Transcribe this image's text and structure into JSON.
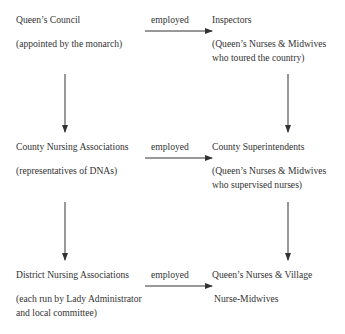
{
  "diagram": {
    "rows": [
      {
        "left": {
          "title": "Queen’s Council",
          "note_lines": [
            "(appointed by the monarch)"
          ]
        },
        "relation": "employed",
        "right": {
          "title": "Inspectors",
          "note_lines": [
            "(Queen’s Nurses & Midwives",
            "who toured the country)"
          ]
        }
      },
      {
        "left": {
          "title": "County Nursing Associations",
          "note_lines": [
            "(representatives of DNAs)"
          ]
        },
        "relation": "employed",
        "right": {
          "title": "County Superintendents",
          "note_lines": [
            "(Queen’s Nurses & Midwives",
            "who supervised nurses)"
          ]
        }
      },
      {
        "left": {
          "title": "District Nursing Associations",
          "note_lines": [
            "(each run by Lady Administrator",
            "and local committee)"
          ]
        },
        "relation": "employed",
        "right": {
          "title": "Queen’s Nurses & Village",
          "note_lines": [
            "Nurse-Midwives"
          ]
        }
      }
    ],
    "edges": [
      {
        "from": "Queen’s Council",
        "to": "Inspectors",
        "label": "employed"
      },
      {
        "from": "Queen’s Council",
        "to": "County Nursing Associations"
      },
      {
        "from": "Inspectors",
        "to": "County Superintendents"
      },
      {
        "from": "County Nursing Associations",
        "to": "County Superintendents",
        "label": "employed"
      },
      {
        "from": "County Nursing Associations",
        "to": "District Nursing Associations"
      },
      {
        "from": "County Superintendents",
        "to": "Queen’s Nurses & Village Nurse-Midwives"
      },
      {
        "from": "District Nursing Associations",
        "to": "Queen’s Nurses & Village Nurse-Midwives",
        "label": "employed"
      }
    ],
    "colors": {
      "text": "#333333",
      "line": "#333333"
    }
  }
}
